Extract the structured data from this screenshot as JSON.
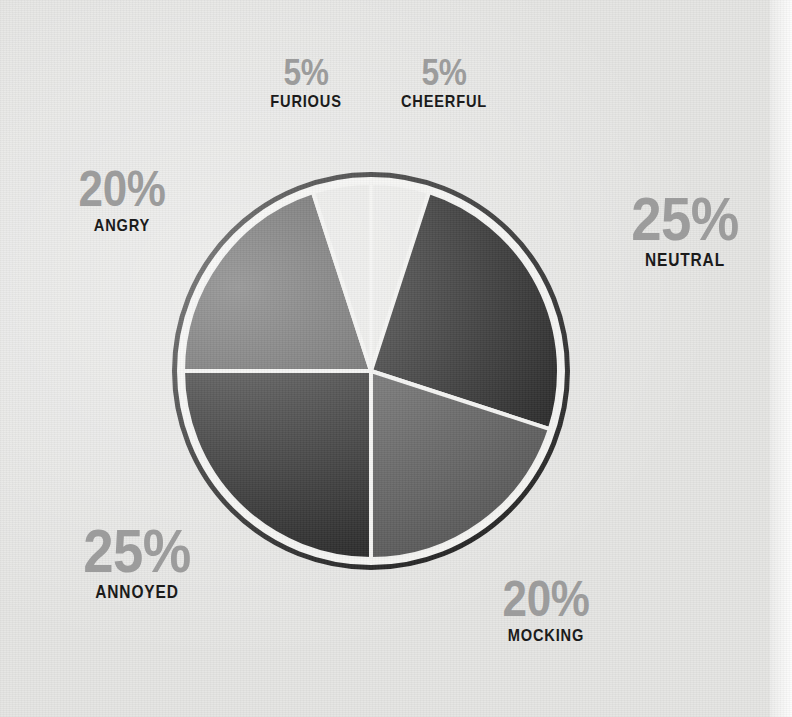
{
  "chart_data": {
    "type": "pie",
    "title": "",
    "subtitle": "",
    "xlabel": "",
    "ylabel": "",
    "legend_position": "callout-labels-around-pie",
    "grid": false,
    "units": "percent",
    "total": 100,
    "start_angle_deg": 0,
    "direction": "clockwise",
    "categories": [
      "CHEERFUL",
      "NEUTRAL",
      "MOCKING",
      "ANNOYED",
      "ANGRY",
      "FURIOUS"
    ],
    "values": [
      5,
      25,
      20,
      25,
      20,
      5
    ],
    "slices": [
      {
        "id": "cheerful",
        "label": "CHEERFUL",
        "percent_text": "5%",
        "value": 5,
        "color": "#e9e9e7",
        "start_deg": 0,
        "end_deg": 18,
        "label_size": "sm"
      },
      {
        "id": "neutral",
        "label": "NEUTRAL",
        "percent_text": "25%",
        "value": 25,
        "color": "#101010",
        "start_deg": 18,
        "end_deg": 108,
        "label_size": "lg"
      },
      {
        "id": "mocking",
        "label": "MOCKING",
        "percent_text": "20%",
        "value": 20,
        "color": "#4a4a4a",
        "start_deg": 108,
        "end_deg": 180,
        "label_size": "md"
      },
      {
        "id": "annoyed",
        "label": "ANNOYED",
        "percent_text": "25%",
        "value": 25,
        "color": "#121212",
        "start_deg": 180,
        "end_deg": 270,
        "label_size": "lg"
      },
      {
        "id": "angry",
        "label": "ANGRY",
        "percent_text": "20%",
        "value": 20,
        "color": "#494949",
        "start_deg": 270,
        "end_deg": 342,
        "label_size": "md"
      },
      {
        "id": "furious",
        "label": "FURIOUS",
        "percent_text": "5%",
        "value": 5,
        "color": "#e7e7e5",
        "start_deg": 342,
        "end_deg": 360,
        "label_size": "sm"
      }
    ]
  },
  "style": {
    "background_color": "#e4e4e2",
    "ring_color": "#141414",
    "separator_color": "#f2f2f0",
    "percent_text_color": "#9c9c9c",
    "label_text_color": "#1b1b1b"
  },
  "callouts": {
    "furious": {
      "percent": "5%",
      "name": "FURIOUS"
    },
    "cheerful": {
      "percent": "5%",
      "name": "CHEERFUL"
    },
    "angry": {
      "percent": "20%",
      "name": "ANGRY"
    },
    "neutral": {
      "percent": "25%",
      "name": "NEUTRAL"
    },
    "annoyed": {
      "percent": "25%",
      "name": "ANNOYED"
    },
    "mocking": {
      "percent": "20%",
      "name": "MOCKING"
    }
  }
}
